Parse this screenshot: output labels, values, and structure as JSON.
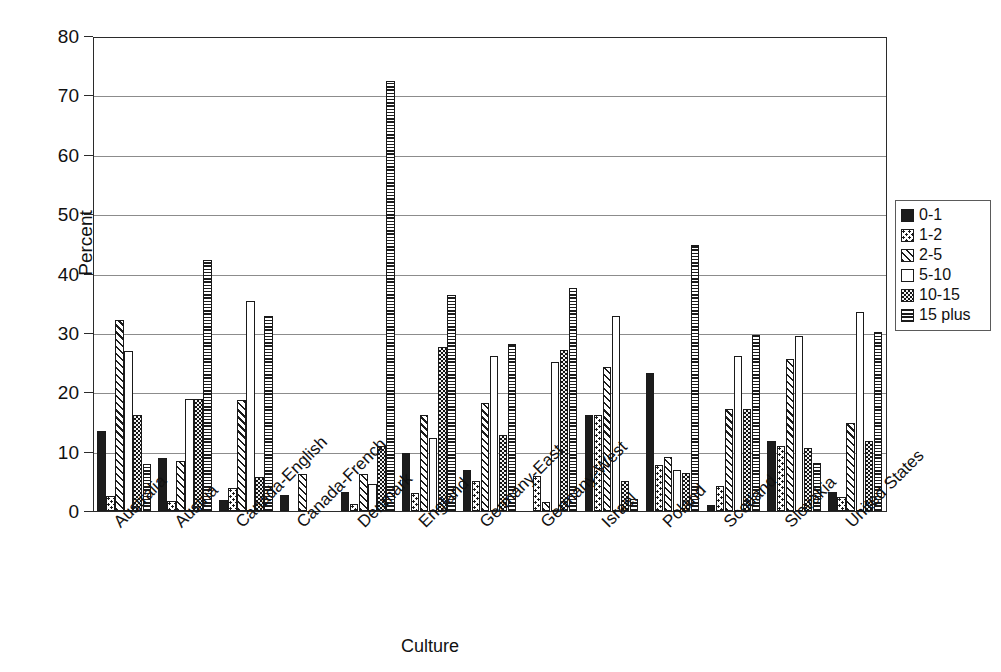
{
  "chart_data": {
    "type": "bar",
    "title": "",
    "xlabel": "Culture",
    "ylabel": "Percent",
    "ylim": [
      0,
      80
    ],
    "ytick_step": 10,
    "yticks": [
      0,
      10,
      20,
      30,
      40,
      50,
      60,
      70,
      80
    ],
    "grid": true,
    "legend_position": "right",
    "categories": [
      "Australia",
      "Austria",
      "Canada-English",
      "Canada-French",
      "Denmark",
      "England",
      "Germany-East",
      "Germany-West",
      "Israel",
      "Poland",
      "Scotland",
      "Slovakia",
      "United States"
    ],
    "series": [
      {
        "name": "0-1",
        "values": [
          13.5,
          9.0,
          1.8,
          2.7,
          3.2,
          9.8,
          7.0,
          0.0,
          16.3,
          23.4,
          1.0,
          11.8,
          3.3
        ]
      },
      {
        "name": "1-2",
        "values": [
          2.5,
          1.7,
          3.9,
          0.0,
          1.2,
          3.1,
          5.0,
          5.9,
          16.2,
          7.8,
          4.3,
          11.0,
          2.3
        ]
      },
      {
        "name": "2-5",
        "values": [
          32.3,
          8.5,
          18.7,
          6.2,
          6.2,
          16.3,
          18.2,
          1.6,
          24.4,
          9.1,
          17.3,
          25.7,
          14.9
        ]
      },
      {
        "name": "5-10",
        "values": [
          27.0,
          19.0,
          35.5,
          0.0,
          4.5,
          12.3,
          26.3,
          25.2,
          33.0,
          7.0,
          26.3,
          29.6,
          33.6
        ]
      },
      {
        "name": "10-15",
        "values": [
          16.3,
          19.0,
          5.8,
          0.0,
          11.0,
          27.7,
          12.8,
          27.3,
          5.0,
          6.5,
          17.3,
          10.7,
          11.9
        ]
      },
      {
        "name": "15 plus",
        "values": [
          8.0,
          42.5,
          33.0,
          0.0,
          72.7,
          36.5,
          28.3,
          37.8,
          2.1,
          45.0,
          29.8,
          8.2,
          30.3
        ]
      }
    ],
    "england_extra_note": "",
    "series_patterns": [
      "solid-black",
      "dotted-white",
      "diagonal-hatch",
      "plain-white",
      "dense-speckle",
      "horizontal-lines"
    ]
  },
  "legend": {
    "items": [
      {
        "label": "0-1"
      },
      {
        "label": "1-2"
      },
      {
        "label": "2-5"
      },
      {
        "label": "5-10"
      },
      {
        "label": "10-15"
      },
      {
        "label": "15 plus"
      }
    ]
  },
  "axes": {
    "y_title": "Percent",
    "x_title": "Culture",
    "y_tick_labels": [
      "0",
      "10",
      "20",
      "30",
      "40",
      "50",
      "60",
      "70",
      "80"
    ]
  },
  "colors": {
    "frame": "#2b2b2b",
    "grid": "#8c8c8c",
    "bar_outline": "#1a1a1a",
    "fill_dark": "#1c1c1c",
    "background": "#ffffff"
  }
}
